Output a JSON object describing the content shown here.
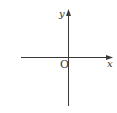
{
  "diagram": {
    "type": "coordinate-axes",
    "colors": {
      "background": "#ffffff",
      "axis": "#3a3a3a",
      "label": "#333333"
    },
    "x_axis": {
      "label": "x",
      "direction": "right",
      "arrow": true
    },
    "y_axis": {
      "label": "y",
      "direction": "up",
      "arrow": true
    },
    "origin": {
      "label": "O"
    }
  }
}
